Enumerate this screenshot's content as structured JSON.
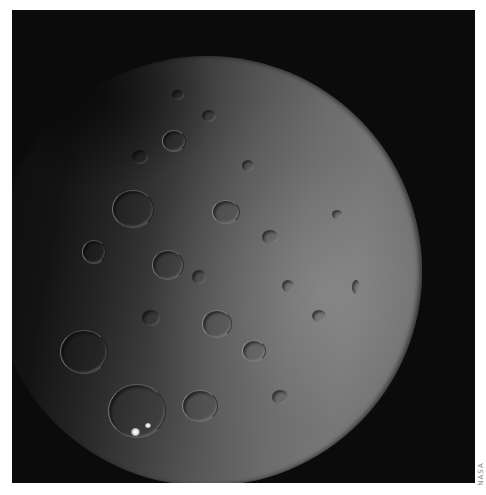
{
  "image": {
    "subject": "cratered dwarf planet surface",
    "background_color": "#0b0b0b",
    "border_color": "#ffffff",
    "surface_colors": {
      "shadow": "#0c0c0c",
      "mid": "#3d3d3d",
      "lit": "#777777",
      "bright_spot": "#ffffff"
    }
  },
  "credit": {
    "text": "NASA"
  }
}
